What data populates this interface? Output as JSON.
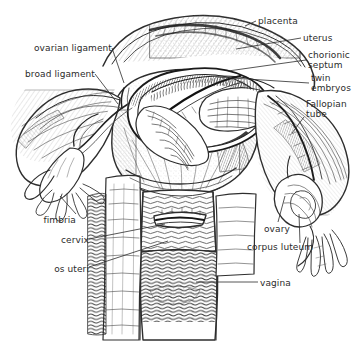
{
  "figure": {
    "background_color": "#ffffff",
    "ink_color": "#2b2b2b",
    "width": 361,
    "height": 343
  },
  "labels": [
    {
      "id": "placenta",
      "text": "placenta",
      "align": "left",
      "x": 258,
      "y": 16,
      "leader": [
        [
          256,
          21
        ],
        [
          245,
          26
        ]
      ]
    },
    {
      "id": "uterus",
      "text": "uterus",
      "align": "left",
      "x": 303,
      "y": 33,
      "leader": [
        [
          301,
          38
        ],
        [
          236,
          49
        ]
      ]
    },
    {
      "id": "chorionic-septum",
      "text": "chorionic\nseptum",
      "align": "left",
      "x": 308,
      "y": 50,
      "leader": [
        [
          306,
          60
        ],
        [
          228,
          71
        ]
      ]
    },
    {
      "id": "twin-embryos",
      "text": "twin\nembryos",
      "align": "left",
      "x": 311,
      "y": 73,
      "leader": [
        [
          309,
          83
        ],
        [
          216,
          77
        ]
      ]
    },
    {
      "id": "fallopian-tube",
      "text": "Fallopian\ntube",
      "align": "left",
      "x": 306,
      "y": 99,
      "leader": [
        [
          304,
          117
        ],
        [
          292,
          133
        ]
      ]
    },
    {
      "id": "ovarian-ligament",
      "text": "ovarian ligament",
      "align": "right",
      "x": 18,
      "y": 43,
      "leader": [
        [
          112,
          48
        ],
        [
          124,
          83
        ]
      ]
    },
    {
      "id": "broad-ligament",
      "text": "broad ligament",
      "align": "right",
      "x": 8,
      "y": 69,
      "leader": [
        [
          95,
          74
        ],
        [
          118,
          104
        ]
      ]
    },
    {
      "id": "fimbria",
      "text": "fimbria",
      "align": "right",
      "x": 38,
      "y": 215,
      "leader": [
        [
          76,
          214
        ],
        [
          60,
          196
        ]
      ]
    },
    {
      "id": "cervix",
      "text": "cervix",
      "align": "right",
      "x": 55,
      "y": 235,
      "leader": [
        [
          89,
          239
        ],
        [
          165,
          224
        ]
      ]
    },
    {
      "id": "os-uteri",
      "text": "os uteri",
      "align": "right",
      "x": 49,
      "y": 264,
      "leader": [
        [
          89,
          267
        ],
        [
          168,
          241
        ]
      ]
    },
    {
      "id": "ovary",
      "text": "ovary",
      "align": "left",
      "x": 264,
      "y": 224,
      "leader": [
        [
          278,
          222
        ],
        [
          285,
          196
        ]
      ]
    },
    {
      "id": "corpus-luteum",
      "text": "corpus luteum",
      "align": "left",
      "x": 247,
      "y": 242,
      "leader": [
        [
          300,
          243
        ],
        [
          299,
          214
        ]
      ]
    },
    {
      "id": "vagina",
      "text": "vagina",
      "align": "left",
      "x": 260,
      "y": 278,
      "leader": [
        [
          258,
          282
        ],
        [
          196,
          282
        ]
      ]
    }
  ],
  "structures": [
    {
      "id": "uterine-body",
      "name": "uterine body"
    },
    {
      "id": "uterine-opening",
      "name": "opened uterine cavity"
    },
    {
      "id": "embryo-left",
      "name": "left twin embryo"
    },
    {
      "id": "embryo-right",
      "name": "right twin embryo"
    },
    {
      "id": "septum",
      "name": "chorionic septum"
    },
    {
      "id": "placenta-tissue",
      "name": "placental tissue"
    },
    {
      "id": "broad-ligament-left",
      "name": "left broad ligament"
    },
    {
      "id": "tube-left",
      "name": "left Fallopian tube"
    },
    {
      "id": "tube-right",
      "name": "right Fallopian tube"
    },
    {
      "id": "fimbria-left",
      "name": "left fimbria"
    },
    {
      "id": "fimbria-right",
      "name": "right fimbria"
    },
    {
      "id": "ovary-right",
      "name": "right ovary with corpus luteum"
    },
    {
      "id": "cervix-body",
      "name": "cervix"
    },
    {
      "id": "vagina-body",
      "name": "vaginal wall with rugae"
    }
  ]
}
